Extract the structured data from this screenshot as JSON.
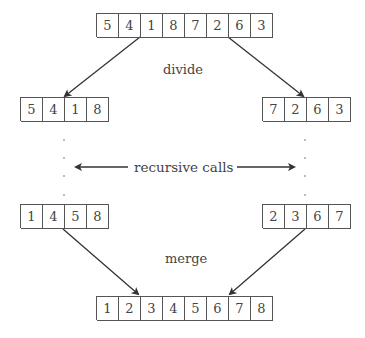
{
  "labels": {
    "divide": "divide",
    "recursive": "recursive calls",
    "merge": "merge"
  },
  "arrays": {
    "input": [
      "5",
      "4",
      "1",
      "8",
      "7",
      "2",
      "6",
      "3"
    ],
    "left_half": [
      "5",
      "4",
      "1",
      "8"
    ],
    "right_half": [
      "7",
      "2",
      "6",
      "3"
    ],
    "left_sorted": [
      "1",
      "4",
      "5",
      "8"
    ],
    "right_sorted": [
      "2",
      "3",
      "6",
      "7"
    ],
    "output": [
      "1",
      "2",
      "3",
      "4",
      "5",
      "6",
      "7",
      "8"
    ]
  },
  "colors": {
    "stroke": "#333333",
    "text": "#444444",
    "box": "#555555"
  }
}
